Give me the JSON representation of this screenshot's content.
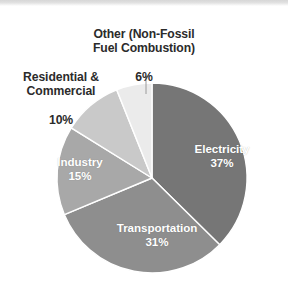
{
  "chart_data": {
    "type": "pie",
    "title": "",
    "subtitle": "",
    "xlabel": "",
    "ylabel": "",
    "legend_position": "none",
    "grid": false,
    "units": "percent",
    "start_angle_deg": 0,
    "direction": "clockwise",
    "categories": [
      "Electricity",
      "Transportation",
      "Industry",
      "Residential & Commercial",
      "Other (Non-Fossil Fuel Combustion)"
    ],
    "values": [
      37,
      31,
      15,
      10,
      6
    ],
    "slices": [
      {
        "label": "Electricity",
        "label_line1": "Electricity",
        "value": 37,
        "value_text": "37%",
        "color": "#767676",
        "label_placement": "inside",
        "label_color": "#ffffff"
      },
      {
        "label": "Transportation",
        "label_line1": "Transportation",
        "value": 31,
        "value_text": "31%",
        "color": "#8e8e8e",
        "label_placement": "inside",
        "label_color": "#ffffff"
      },
      {
        "label": "Industry",
        "label_line1": "Industry",
        "value": 15,
        "value_text": "15%",
        "color": "#a8a8a8",
        "label_placement": "inside",
        "label_color": "#ffffff"
      },
      {
        "label": "Residential & Commercial",
        "label_line1": "Residential &",
        "label_line2": "Commercial",
        "value": 10,
        "value_text": "10%",
        "color": "#c9c9c9",
        "label_placement": "outside",
        "label_color": "#2b2b2b"
      },
      {
        "label": "Other (Non-Fossil Fuel Combustion)",
        "label_line1": "Other (Non-Fossil",
        "label_line2": "Fuel Combustion)",
        "value": 6,
        "value_text": "6%",
        "color": "#ebebeb",
        "label_placement": "outside",
        "label_color": "#2b2b2b",
        "has_leader_line": true
      }
    ]
  },
  "figure": {
    "background": "#ffffff",
    "slice_border_color": "#ffffff",
    "pie_center_x": 152,
    "pie_center_y": 178,
    "pie_radius": 95
  }
}
